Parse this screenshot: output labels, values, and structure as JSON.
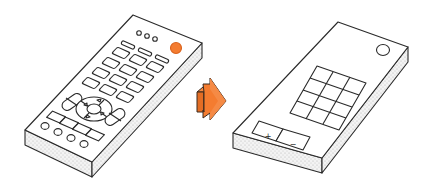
{
  "illustration": {
    "title": "Remote control simplification",
    "colors": {
      "stroke": "#2a2a2a",
      "face": "#ffffff",
      "side": "#efefef",
      "dots": "#bdbdbd",
      "accent": "#f47c30",
      "accent_dark": "#d9621c"
    },
    "left_remote": {
      "name": "complex-remote",
      "top_dots": 3,
      "power_button": "orange",
      "button_grid": "4 rows x 3 columns rounded keys",
      "dpad": "circular directional pad with 4 triangle arrows",
      "rockers": 2,
      "bottom_row_buttons": 4,
      "bottom_keys": 4
    },
    "arrow": {
      "name": "transformation-arrow",
      "direction": "right"
    },
    "right_remote": {
      "name": "simplified-remote",
      "power_button": "circle",
      "grid": "4 rows x 3 columns",
      "volume": {
        "plus": "+",
        "minus": "−"
      }
    }
  }
}
